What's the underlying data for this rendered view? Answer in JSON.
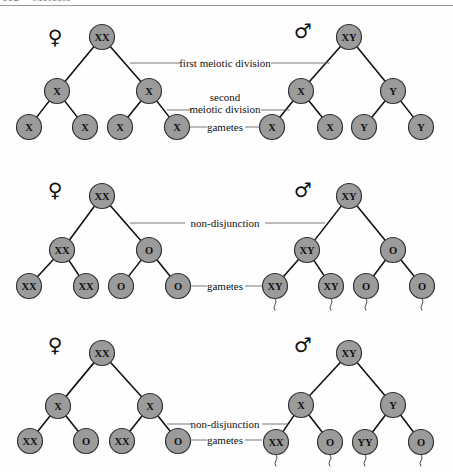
{
  "header": {
    "page_number": "112",
    "chapter": "Meiosis"
  },
  "colors": {
    "node_fill": "#9b9b9b",
    "node_stroke": "#333333",
    "line": "#111111"
  },
  "symbols": {
    "female": "♀",
    "male": "♂"
  },
  "panels": [
    {
      "id": "normal",
      "female": {
        "symbol_pos": [
          55,
          37
        ],
        "root": {
          "label": "XX",
          "pos": [
            102,
            37
          ]
        },
        "mid": [
          {
            "label": "X",
            "pos": [
              57,
              91
            ]
          },
          {
            "label": "X",
            "pos": [
              149,
              91
            ]
          }
        ],
        "gametes": [
          {
            "label": "X",
            "pos": [
              29,
              127
            ]
          },
          {
            "label": "X",
            "pos": [
              85,
              127
            ]
          },
          {
            "label": "X",
            "pos": [
              120,
              127
            ]
          },
          {
            "label": "X",
            "pos": [
              177,
              127
            ]
          }
        ],
        "tails": false
      },
      "male": {
        "symbol_pos": [
          303,
          31
        ],
        "root": {
          "label": "XY",
          "pos": [
            349,
            37
          ]
        },
        "mid": [
          {
            "label": "X",
            "pos": [
              301,
              91
            ]
          },
          {
            "label": "Y",
            "pos": [
              393,
              91
            ]
          }
        ],
        "gametes": [
          {
            "label": "X",
            "pos": [
              272,
              127
            ]
          },
          {
            "label": "X",
            "pos": [
              330,
              127
            ]
          },
          {
            "label": "Y",
            "pos": [
              364,
              127
            ]
          },
          {
            "label": "Y",
            "pos": [
              421,
              127
            ]
          }
        ],
        "tails": false
      },
      "callouts": [
        {
          "lines": [
            "first meiotic division"
          ],
          "y": 63,
          "x": 225,
          "left": [
            130,
            180
          ],
          "right": [
            271,
            330
          ]
        },
        {
          "lines": [
            "second",
            "meiotic division"
          ],
          "y": 109,
          "x": 225,
          "left": [
            167,
            192
          ],
          "right": [
            261,
            290
          ],
          "line_y": 110
        },
        {
          "lines": [
            "gametes"
          ],
          "y": 127,
          "x": 225,
          "left": [
            190,
            207
          ],
          "right": [
            245,
            260
          ]
        }
      ]
    },
    {
      "id": "first-division-nondisjunction",
      "female": {
        "symbol_pos": [
          55,
          190
        ],
        "root": {
          "label": "XX",
          "pos": [
            102,
            196
          ]
        },
        "mid": [
          {
            "label": "XX",
            "pos": [
              62,
              250
            ]
          },
          {
            "label": "O",
            "pos": [
              149,
              250
            ]
          }
        ],
        "gametes": [
          {
            "label": "XX",
            "pos": [
              29,
              286
            ]
          },
          {
            "label": "XX",
            "pos": [
              86,
              286
            ]
          },
          {
            "label": "O",
            "pos": [
              121,
              286
            ]
          },
          {
            "label": "O",
            "pos": [
              178,
              286
            ]
          }
        ],
        "tails": false
      },
      "male": {
        "symbol_pos": [
          303,
          190
        ],
        "root": {
          "label": "XY",
          "pos": [
            349,
            196
          ]
        },
        "mid": [
          {
            "label": "XY",
            "pos": [
              307,
              250
            ]
          },
          {
            "label": "O",
            "pos": [
              393,
              250
            ]
          }
        ],
        "gametes": [
          {
            "label": "XY",
            "pos": [
              275,
              286
            ]
          },
          {
            "label": "XY",
            "pos": [
              331,
              286
            ]
          },
          {
            "label": "O",
            "pos": [
              366,
              286
            ]
          },
          {
            "label": "O",
            "pos": [
              422,
              286
            ]
          }
        ],
        "tails": true
      },
      "callouts": [
        {
          "lines": [
            "non-disjunction"
          ],
          "y": 223,
          "x": 225,
          "left": [
            130,
            185
          ],
          "right": [
            265,
            325
          ]
        },
        {
          "lines": [
            "gametes"
          ],
          "y": 286,
          "x": 225,
          "left": [
            190,
            207
          ],
          "right": [
            245,
            262
          ]
        }
      ]
    },
    {
      "id": "second-division-nondisjunction",
      "female": {
        "symbol_pos": [
          55,
          345
        ],
        "root": {
          "label": "XX",
          "pos": [
            102,
            353
          ]
        },
        "mid": [
          {
            "label": "X",
            "pos": [
              58,
              406
            ]
          },
          {
            "label": "X",
            "pos": [
              150,
              406
            ]
          }
        ],
        "gametes": [
          {
            "label": "XX",
            "pos": [
              30,
              441
            ]
          },
          {
            "label": "O",
            "pos": [
              86,
              441
            ]
          },
          {
            "label": "XX",
            "pos": [
              122,
              441
            ]
          },
          {
            "label": "O",
            "pos": [
              178,
              441
            ]
          }
        ],
        "tails": false
      },
      "male": {
        "symbol_pos": [
          303,
          345
        ],
        "root": {
          "label": "XY",
          "pos": [
            349,
            353
          ]
        },
        "mid": [
          {
            "label": "X",
            "pos": [
              301,
              405
            ]
          },
          {
            "label": "Y",
            "pos": [
              393,
              405
            ]
          }
        ],
        "gametes": [
          {
            "label": "XX",
            "pos": [
              276,
              442
            ]
          },
          {
            "label": "O",
            "pos": [
              330,
              442
            ]
          },
          {
            "label": "YY",
            "pos": [
              365,
              442
            ]
          },
          {
            "label": "O",
            "pos": [
              421,
              442
            ]
          }
        ],
        "tails": true
      },
      "callouts": [
        {
          "lines": [
            "non-disjunction"
          ],
          "y": 424,
          "x": 225,
          "left": [
            167,
            192
          ],
          "right": [
            262,
            288
          ]
        },
        {
          "lines": [
            "gametes"
          ],
          "y": 440,
          "x": 225,
          "left": [
            190,
            207
          ],
          "right": [
            245,
            262
          ]
        }
      ]
    }
  ]
}
